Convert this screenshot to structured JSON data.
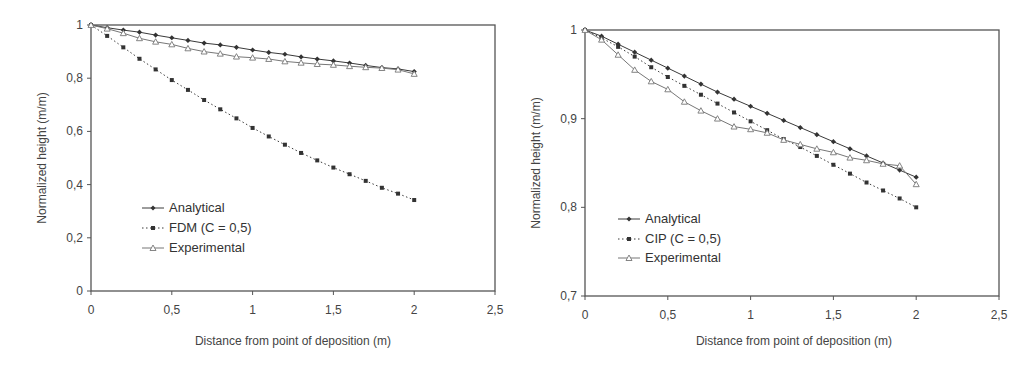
{
  "chart_data": [
    {
      "type": "line",
      "title": "",
      "xlabel": "Distance from point of deposition (m)",
      "ylabel": "Normalized height (m/m)",
      "xlim": [
        0,
        2.5
      ],
      "ylim": [
        0,
        1
      ],
      "x_ticks": [
        "0",
        "0,5",
        "1",
        "1,5",
        "2",
        "2,5"
      ],
      "y_ticks": [
        "0",
        "0,2",
        "0,4",
        "0,6",
        "0,8",
        "1"
      ],
      "grid": false,
      "legend_position": "lower-left inside",
      "x": [
        0,
        0.1,
        0.2,
        0.3,
        0.4,
        0.5,
        0.6,
        0.7,
        0.8,
        0.9,
        1.0,
        1.1,
        1.2,
        1.3,
        1.4,
        1.5,
        1.6,
        1.7,
        1.8,
        1.9,
        2.0
      ],
      "series": [
        {
          "name": "Analytical",
          "style": "solid",
          "marker": "diamond",
          "values": [
            1.0,
            0.99,
            0.981,
            0.973,
            0.962,
            0.952,
            0.942,
            0.932,
            0.925,
            0.916,
            0.906,
            0.897,
            0.89,
            0.88,
            0.872,
            0.865,
            0.857,
            0.848,
            0.84,
            0.835,
            0.825
          ]
        },
        {
          "name": "FDM (C = 0,5)",
          "style": "dotted",
          "marker": "square",
          "values": [
            1.0,
            0.959,
            0.916,
            0.873,
            0.833,
            0.793,
            0.756,
            0.718,
            0.683,
            0.649,
            0.613,
            0.581,
            0.55,
            0.519,
            0.491,
            0.464,
            0.439,
            0.414,
            0.388,
            0.366,
            0.342
          ]
        },
        {
          "name": "Experimental",
          "style": "solid",
          "marker": "open-triangle",
          "values": [
            1.0,
            0.986,
            0.969,
            0.95,
            0.937,
            0.927,
            0.912,
            0.9,
            0.892,
            0.881,
            0.877,
            0.872,
            0.863,
            0.858,
            0.853,
            0.85,
            0.845,
            0.841,
            0.838,
            0.832,
            0.816
          ]
        }
      ]
    },
    {
      "type": "line",
      "title": "",
      "xlabel": "Distance from point of deposition (m)",
      "ylabel": "Normalized height (m/m)",
      "xlim": [
        0,
        2.5
      ],
      "ylim": [
        0.7,
        1
      ],
      "x_ticks": [
        "0",
        "0,5",
        "1",
        "1,5",
        "2",
        "2,5"
      ],
      "y_ticks": [
        "0,7",
        "0,8",
        "0,9",
        "1"
      ],
      "grid": false,
      "legend_position": "lower-left inside",
      "x": [
        0,
        0.1,
        0.2,
        0.3,
        0.4,
        0.5,
        0.6,
        0.7,
        0.8,
        0.9,
        1.0,
        1.1,
        1.2,
        1.3,
        1.4,
        1.5,
        1.6,
        1.7,
        1.8,
        1.9,
        2.0
      ],
      "series": [
        {
          "name": "Analytical",
          "style": "solid",
          "marker": "diamond",
          "values": [
            1.0,
            0.993,
            0.984,
            0.975,
            0.966,
            0.957,
            0.948,
            0.939,
            0.93,
            0.922,
            0.914,
            0.906,
            0.898,
            0.89,
            0.882,
            0.874,
            0.866,
            0.858,
            0.85,
            0.842,
            0.834
          ]
        },
        {
          "name": "CIP (C = 0,5)",
          "style": "dotted",
          "marker": "square",
          "values": [
            1.0,
            0.991,
            0.981,
            0.97,
            0.958,
            0.947,
            0.937,
            0.927,
            0.917,
            0.907,
            0.897,
            0.887,
            0.877,
            0.868,
            0.858,
            0.848,
            0.838,
            0.828,
            0.819,
            0.81,
            0.8
          ]
        },
        {
          "name": "Experimental",
          "style": "solid",
          "marker": "open-triangle",
          "values": [
            1.0,
            0.989,
            0.972,
            0.955,
            0.942,
            0.933,
            0.919,
            0.909,
            0.9,
            0.891,
            0.888,
            0.884,
            0.876,
            0.871,
            0.866,
            0.862,
            0.856,
            0.853,
            0.849,
            0.847,
            0.826
          ]
        }
      ]
    }
  ],
  "charts": {
    "left": {
      "xlabel": "Distance from point of deposition (m)",
      "ylabel": "Normalized height (m/m)",
      "legend": [
        "Analytical",
        "FDM (C = 0,5)",
        "Experimental"
      ]
    },
    "right": {
      "xlabel": "Distance from point of deposition (m)",
      "ylabel": "Normalized height (m/m)",
      "legend": [
        "Analytical",
        "CIP (C = 0,5)",
        "Experimental"
      ]
    }
  },
  "colors": {
    "axis": "#444444",
    "analytical": "#3a3a3a",
    "numerical": "#3a3a3a",
    "experimental": "#777777"
  }
}
